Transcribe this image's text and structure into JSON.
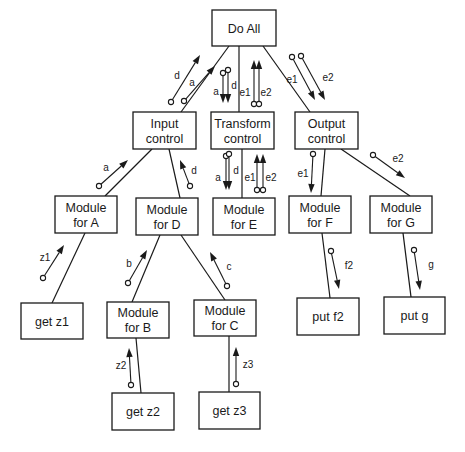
{
  "modules": [
    {
      "id": "do_all",
      "lines": [
        "Do All"
      ],
      "x": 212,
      "y": 10,
      "w": 64,
      "h": 36
    },
    {
      "id": "input_control",
      "lines": [
        "Input",
        "control"
      ],
      "x": 133,
      "y": 112,
      "w": 63,
      "h": 37
    },
    {
      "id": "transform_control",
      "lines": [
        "Transform",
        "control"
      ],
      "x": 211,
      "y": 112,
      "w": 63,
      "h": 37
    },
    {
      "id": "output_control",
      "lines": [
        "Output",
        "control"
      ],
      "x": 295,
      "y": 112,
      "w": 63,
      "h": 37
    },
    {
      "id": "module_a",
      "lines": [
        "Module",
        "for A"
      ],
      "x": 55,
      "y": 196,
      "w": 62,
      "h": 37
    },
    {
      "id": "module_d",
      "lines": [
        "Module",
        "for D"
      ],
      "x": 136,
      "y": 198,
      "w": 62,
      "h": 37
    },
    {
      "id": "module_e",
      "lines": [
        "Module",
        "for E"
      ],
      "x": 213,
      "y": 198,
      "w": 62,
      "h": 37
    },
    {
      "id": "module_f",
      "lines": [
        "Module",
        "for F"
      ],
      "x": 289,
      "y": 196,
      "w": 62,
      "h": 37
    },
    {
      "id": "module_g",
      "lines": [
        "Module",
        "for G"
      ],
      "x": 370,
      "y": 196,
      "w": 62,
      "h": 37
    },
    {
      "id": "get_z1",
      "lines": [
        "get z1"
      ],
      "x": 21,
      "y": 303,
      "w": 62,
      "h": 36
    },
    {
      "id": "module_b",
      "lines": [
        "Module",
        "for B"
      ],
      "x": 107,
      "y": 302,
      "w": 62,
      "h": 36
    },
    {
      "id": "module_c",
      "lines": [
        "Module",
        "for C"
      ],
      "x": 194,
      "y": 300,
      "w": 62,
      "h": 36
    },
    {
      "id": "put_f2",
      "lines": [
        "put f2"
      ],
      "x": 297,
      "y": 298,
      "w": 62,
      "h": 37
    },
    {
      "id": "put_g",
      "lines": [
        "put g"
      ],
      "x": 384,
      "y": 297,
      "w": 61,
      "h": 37
    },
    {
      "id": "get_z2",
      "lines": [
        "get z2"
      ],
      "x": 112,
      "y": 393,
      "w": 62,
      "h": 37
    },
    {
      "id": "get_z3",
      "lines": [
        "get z3"
      ],
      "x": 199,
      "y": 392,
      "w": 61,
      "h": 37
    }
  ],
  "connections": [
    {
      "from": "do_all",
      "to": "input_control",
      "x1": 229,
      "y1": 46,
      "x2": 181,
      "y2": 112
    },
    {
      "from": "do_all",
      "to": "transform_control",
      "x1": 239,
      "y1": 46,
      "x2": 239,
      "y2": 112
    },
    {
      "from": "do_all",
      "to": "output_control",
      "x1": 263,
      "y1": 46,
      "x2": 310,
      "y2": 112
    },
    {
      "from": "input_control",
      "to": "module_a",
      "x1": 152,
      "y1": 149,
      "x2": 105,
      "y2": 196
    },
    {
      "from": "input_control",
      "to": "module_d",
      "x1": 169,
      "y1": 149,
      "x2": 180,
      "y2": 198
    },
    {
      "from": "transform_control",
      "to": "module_e",
      "x1": 242,
      "y1": 149,
      "x2": 242,
      "y2": 198
    },
    {
      "from": "output_control",
      "to": "module_f",
      "x1": 325,
      "y1": 149,
      "x2": 321,
      "y2": 196
    },
    {
      "from": "output_control",
      "to": "module_g",
      "x1": 341,
      "y1": 149,
      "x2": 410,
      "y2": 196
    },
    {
      "from": "module_a",
      "to": "get_z1",
      "x1": 85,
      "y1": 233,
      "x2": 52,
      "y2": 303
    },
    {
      "from": "module_d",
      "to": "module_b",
      "x1": 160,
      "y1": 235,
      "x2": 132,
      "y2": 302
    },
    {
      "from": "module_d",
      "to": "module_c",
      "x1": 181,
      "y1": 235,
      "x2": 225,
      "y2": 300
    },
    {
      "from": "module_f",
      "to": "put_f2",
      "x1": 322,
      "y1": 233,
      "x2": 330,
      "y2": 298
    },
    {
      "from": "module_g",
      "to": "put_g",
      "x1": 403,
      "y1": 233,
      "x2": 411,
      "y2": 297
    },
    {
      "from": "module_b",
      "to": "get_z2",
      "x1": 136,
      "y1": 338,
      "x2": 141,
      "y2": 393
    },
    {
      "from": "module_c",
      "to": "get_z3",
      "x1": 229,
      "y1": 336,
      "x2": 229,
      "y2": 392
    }
  ],
  "data_flows": [
    {
      "label": "d",
      "tail": [
        171,
        102
      ],
      "head": [
        200,
        55
      ],
      "lx": 177,
      "ly": 79
    },
    {
      "label": "a",
      "tail": [
        184,
        101
      ],
      "head": [
        215,
        66
      ],
      "lx": 192,
      "ly": 86
    },
    {
      "label": "a",
      "tail": [
        223,
        73
      ],
      "head": [
        223,
        103
      ],
      "lx": 216,
      "ly": 95
    },
    {
      "label": "d",
      "tail": [
        228,
        70
      ],
      "head": [
        228,
        103
      ],
      "lx": 234,
      "ly": 89
    },
    {
      "label": "e1",
      "tail": [
        254,
        104
      ],
      "head": [
        254,
        60
      ],
      "lx": 245,
      "ly": 96
    },
    {
      "label": "e2",
      "tail": [
        259,
        104
      ],
      "head": [
        259,
        60
      ],
      "lx": 266,
      "ly": 96
    },
    {
      "label": "e1",
      "tail": [
        292,
        57
      ],
      "head": [
        315,
        100
      ],
      "lx": 292,
      "ly": 83
    },
    {
      "label": "e2",
      "tail": [
        301,
        56
      ],
      "head": [
        325,
        100
      ],
      "lx": 328,
      "ly": 81
    },
    {
      "label": "a",
      "tail": [
        99,
        186
      ],
      "head": [
        128,
        160
      ],
      "lx": 106,
      "ly": 171
    },
    {
      "label": "d",
      "tail": [
        190,
        186
      ],
      "head": [
        180,
        160
      ],
      "lx": 194,
      "ly": 174
    },
    {
      "label": "a",
      "tail": [
        226,
        156
      ],
      "head": [
        226,
        190
      ],
      "lx": 218,
      "ly": 181
    },
    {
      "label": "d",
      "tail": [
        229,
        154
      ],
      "head": [
        229,
        190
      ],
      "lx": 236,
      "ly": 174
    },
    {
      "label": "e1",
      "tail": [
        257,
        190
      ],
      "head": [
        257,
        154
      ],
      "lx": 250,
      "ly": 181
    },
    {
      "label": "e2",
      "tail": [
        263,
        190
      ],
      "head": [
        263,
        154
      ],
      "lx": 271,
      "ly": 181
    },
    {
      "label": "e1",
      "tail": [
        313,
        154
      ],
      "head": [
        311,
        193
      ],
      "lx": 303,
      "ly": 177
    },
    {
      "label": "e2",
      "tail": [
        373,
        155
      ],
      "head": [
        405,
        178
      ],
      "lx": 398,
      "ly": 162
    },
    {
      "label": "z1",
      "tail": [
        43,
        278
      ],
      "head": [
        64,
        245
      ],
      "lx": 45,
      "ly": 261
    },
    {
      "label": "b",
      "tail": [
        128,
        283
      ],
      "head": [
        147,
        250
      ],
      "lx": 129,
      "ly": 267
    },
    {
      "label": "c",
      "tail": [
        227,
        286
      ],
      "head": [
        210,
        252
      ],
      "lx": 229,
      "ly": 270
    },
    {
      "label": "f2",
      "tail": [
        331,
        251
      ],
      "head": [
        339,
        289
      ],
      "lx": 349,
      "ly": 269
    },
    {
      "label": "g",
      "tail": [
        414,
        250
      ],
      "head": [
        420,
        290
      ],
      "lx": 431,
      "ly": 268
    },
    {
      "label": "z2",
      "tail": [
        131,
        385
      ],
      "head": [
        129,
        348
      ],
      "lx": 121,
      "ly": 369
    },
    {
      "label": "z3",
      "tail": [
        236,
        384
      ],
      "head": [
        236,
        347
      ],
      "lx": 248,
      "ly": 368
    }
  ],
  "colors": {
    "line": "#1a1a1a",
    "background": "#ffffff"
  }
}
